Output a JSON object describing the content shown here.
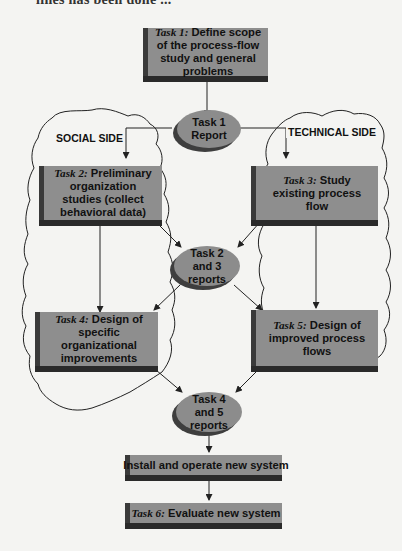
{
  "page_fragment": "lines has been done ...",
  "colors": {
    "background": "#f4f4f2",
    "box_face": "#8e8e8e",
    "box_shadow": "#2a2a2a",
    "line": "#222222"
  },
  "regions": {
    "social": {
      "label": "SOCIAL SIDE"
    },
    "technical": {
      "label": "TECHNICAL SIDE"
    }
  },
  "nodes": {
    "task1": {
      "prefix": "Task 1:",
      "text": " Define scope of the process-flow study and general problems"
    },
    "report1": {
      "text": "Task 1 Report"
    },
    "task2": {
      "prefix": "Task 2:",
      "text": " Preliminary organization studies (collect behavioral data)"
    },
    "task3": {
      "prefix": "Task 3:",
      "text": " Study existing process flow"
    },
    "report23": {
      "text": "Task 2 and 3 reports"
    },
    "task4": {
      "prefix": "Task 4:",
      "text": " Design of specific organizational improvements"
    },
    "task5": {
      "prefix": "Task 5:",
      "text": " Design of improved process flows"
    },
    "report45": {
      "text": "Task 4 and 5 reports"
    },
    "install": {
      "text": "Install and operate new system"
    },
    "task6": {
      "prefix": "Task 6:",
      "text": " Evaluate new system"
    }
  },
  "edges": [
    [
      "task1",
      "report1"
    ],
    [
      "report1",
      "task2"
    ],
    [
      "report1",
      "task3"
    ],
    [
      "task2",
      "report23"
    ],
    [
      "task3",
      "report23"
    ],
    [
      "task2",
      "task4"
    ],
    [
      "task3",
      "task5"
    ],
    [
      "report23",
      "task4"
    ],
    [
      "report23",
      "task5"
    ],
    [
      "task4",
      "report45"
    ],
    [
      "task5",
      "report45"
    ],
    [
      "report45",
      "install"
    ],
    [
      "install",
      "task6"
    ]
  ]
}
